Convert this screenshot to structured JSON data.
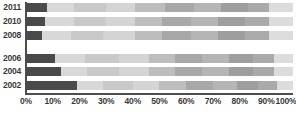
{
  "chart_data": {
    "type": "bar",
    "subtype": "horizontal-stacked-100-percent",
    "title": "",
    "subtitle": "",
    "xlabel": "",
    "ylabel": "",
    "xlim": [
      0,
      100
    ],
    "grid": false,
    "legend": "none",
    "orientation": "horizontal",
    "stacked": true,
    "normalized_percent": true,
    "axis": {
      "ticks": [
        0,
        10,
        20,
        30,
        40,
        50,
        60,
        70,
        80,
        90,
        100
      ],
      "tick_labels": [
        "0%",
        "10%",
        "20%",
        "30%",
        "40%",
        "50%",
        "60%",
        "70%",
        "80%",
        "90%",
        "100%"
      ],
      "line_color": "#4d4d4d"
    },
    "categories": [
      "2011",
      "2010",
      "2008",
      "2006",
      "2004",
      "2002"
    ],
    "series": [
      {
        "name": "Segment 1",
        "color": "#4a4a4a",
        "values": [
          8,
          7,
          6,
          11,
          13,
          19
        ]
      },
      {
        "name": "Segment 2",
        "color": "#d8d8d8",
        "values": [
          10,
          11,
          11,
          11,
          10,
          10
        ]
      },
      {
        "name": "Segment 3",
        "color": "#c9c9c9",
        "values": [
          12,
          12,
          12,
          13,
          12,
          11
        ]
      },
      {
        "name": "Segment 4",
        "color": "#d4d4d4",
        "values": [
          11,
          11,
          12,
          11,
          11,
          10
        ]
      },
      {
        "name": "Segment 5",
        "color": "#bdbdbd",
        "values": [
          11,
          10,
          10,
          10,
          10,
          10
        ]
      },
      {
        "name": "Segment 6",
        "color": "#a8a8a8",
        "values": [
          11,
          11,
          11,
          10,
          10,
          10
        ]
      },
      {
        "name": "Segment 7",
        "color": "#b5b5b5",
        "values": [
          10,
          10,
          10,
          10,
          10,
          9
        ]
      },
      {
        "name": "Segment 8",
        "color": "#9e9e9e",
        "values": [
          10,
          10,
          10,
          9,
          9,
          8
        ]
      },
      {
        "name": "Segment 9",
        "color": "#aaaaaa",
        "values": [
          8,
          9,
          9,
          8,
          8,
          7
        ]
      },
      {
        "name": "Segment 10",
        "color": "#dcdcdc",
        "values": [
          9,
          9,
          9,
          7,
          7,
          6
        ]
      }
    ]
  },
  "chart": {
    "bar_geometry": {
      "row_tops": [
        3,
        17,
        31,
        54,
        67,
        81
      ],
      "row_height": 9
    }
  }
}
